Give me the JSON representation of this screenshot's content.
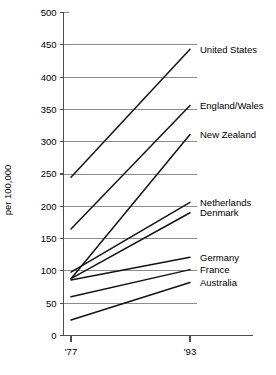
{
  "chart_data": {
    "type": "line",
    "title": "",
    "xlabel": "",
    "ylabel": "per 100,000",
    "x": [
      "'77",
      "'93"
    ],
    "xtick_labels": [
      "'77",
      "'93"
    ],
    "ytick_labels": [
      "0",
      "50",
      "100",
      "150",
      "200",
      "250",
      "300",
      "350",
      "400",
      "450",
      "500"
    ],
    "yticks": [
      0,
      50,
      100,
      150,
      200,
      250,
      300,
      350,
      400,
      450,
      500
    ],
    "ylim": [
      0,
      500
    ],
    "grid": "horizontal",
    "legend_position": "right-inline-labels",
    "line_color": "#141414",
    "grid_color": "#8c8c8c",
    "series": [
      {
        "name": "United States",
        "values": [
          245,
          443
        ]
      },
      {
        "name": "England/Wales",
        "values": [
          165,
          356
        ]
      },
      {
        "name": "New Zealand",
        "values": [
          88,
          311
        ]
      },
      {
        "name": "Netherlands",
        "values": [
          98,
          206
        ]
      },
      {
        "name": "Denmark",
        "values": [
          88,
          190
        ]
      },
      {
        "name": "Germany",
        "values": [
          86,
          121
        ]
      },
      {
        "name": "France",
        "values": [
          60,
          102
        ]
      },
      {
        "name": "Australia",
        "values": [
          24,
          82
        ]
      }
    ]
  }
}
